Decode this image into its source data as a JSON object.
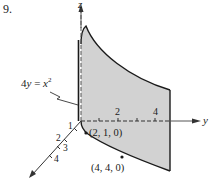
{
  "problem_number": "9.",
  "axes": {
    "z_label": "z",
    "y_label": "y",
    "y_ticks": [
      "2",
      "4"
    ],
    "x_ticks": [
      "1",
      "2",
      "3",
      "4"
    ]
  },
  "equation": {
    "label": "4y = x²",
    "lhs": "4",
    "var_y": "y",
    "eq": " = ",
    "var_x": "x",
    "exp": "2"
  },
  "points": [
    {
      "label": "(2, 1, 0)"
    },
    {
      "label": "(4, 4, 0)"
    }
  ],
  "colors": {
    "surface_fill": "#d2d2d2",
    "line": "#1a1a1a",
    "axis": "#555555"
  }
}
